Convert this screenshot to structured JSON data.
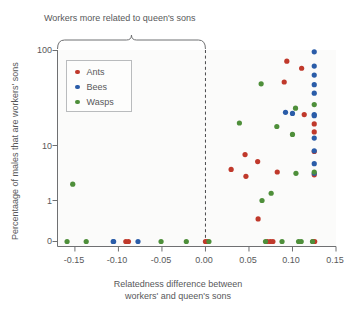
{
  "chart_data": {
    "type": "scatter",
    "title": "",
    "annotation": "Workers more related to queen's sons",
    "xlabel_line1": "Relatedness difference between",
    "xlabel_line2": "workers' and queen's sons",
    "ylabel": "Percentaage of males that are workers' sons",
    "xlim": [
      -0.17,
      0.15
    ],
    "ylim_note": "log-like axis with 0 shown below 1",
    "xticks": [
      -0.15,
      -0.1,
      -0.05,
      0.0,
      0.05,
      0.1,
      0.15
    ],
    "xticklabels": [
      "-0.15",
      "-0.10",
      "-0.05",
      "0.00",
      "0.05",
      "0.10",
      "0.15"
    ],
    "yticks": [
      100,
      10,
      1,
      0
    ],
    "yticklabels": [
      "100",
      "10",
      "1",
      "0"
    ],
    "grid": false,
    "legend_position": "upper-left",
    "reference_line_x": 0.0,
    "colors": {
      "ants": "#c0392b",
      "bees": "#2a5ca8",
      "wasps": "#4e8f3a",
      "axis": "#6f7072",
      "text": "#58585a",
      "plot_bg": "#fbfbfa"
    },
    "series": [
      {
        "name": "Ants",
        "color": "#c0392b",
        "points": [
          [
            -0.0915,
            0
          ],
          [
            -0.0885,
            0
          ],
          [
            0.0295,
            2.6
          ],
          [
            0.0455,
            4.1
          ],
          [
            0.0465,
            2.1
          ],
          [
            0.06,
            3.3
          ],
          [
            0.0605,
            0.55
          ],
          [
            0.071,
            0
          ],
          [
            0.0745,
            0
          ],
          [
            0.0775,
            0
          ],
          [
            0.0825,
            2.4
          ],
          [
            0.0905,
            38
          ],
          [
            0.0935,
            72
          ],
          [
            0.1105,
            58
          ],
          [
            0.1135,
            14
          ],
          [
            0.1235,
            0
          ],
          [
            0.125,
            10.5
          ],
          [
            0.125,
            8.2
          ],
          [
            0.125,
            4.5
          ],
          [
            0.125,
            2.2
          ],
          [
            0.1255,
            0
          ],
          [
            0.0,
            0
          ],
          [
            0.0025,
            0
          ]
        ]
      },
      {
        "name": "Bees",
        "color": "#2a5ca8",
        "points": [
          [
            -0.106,
            0
          ],
          [
            -0.1055,
            0
          ],
          [
            -0.0775,
            0
          ],
          [
            0.092,
            15
          ],
          [
            0.1,
            14.5
          ],
          [
            0.125,
            96
          ],
          [
            0.125,
            62
          ],
          [
            0.125,
            47
          ],
          [
            0.125,
            35
          ],
          [
            0.125,
            27
          ],
          [
            0.125,
            14
          ],
          [
            0.125,
            13.5
          ],
          [
            0.125,
            6.8
          ],
          [
            0.125,
            4.6
          ],
          [
            0.125,
            3.1
          ],
          [
            0.125,
            2.3
          ]
        ]
      },
      {
        "name": "Wasps",
        "color": "#4e8f3a",
        "points": [
          [
            -0.1525,
            1.65
          ],
          [
            -0.159,
            0
          ],
          [
            -0.137,
            0
          ],
          [
            -0.051,
            0
          ],
          [
            -0.022,
            0
          ],
          [
            0.004,
            0
          ],
          [
            0.039,
            10.8
          ],
          [
            0.064,
            36
          ],
          [
            0.065,
            1.0
          ],
          [
            0.069,
            0
          ],
          [
            0.0755,
            1.25
          ],
          [
            0.082,
            9.7
          ],
          [
            0.088,
            0
          ],
          [
            0.1,
            7.6
          ],
          [
            0.1035,
            17
          ],
          [
            0.104,
            2.3
          ],
          [
            0.107,
            0
          ],
          [
            0.11,
            0
          ],
          [
            0.123,
            0
          ],
          [
            0.125,
            19
          ],
          [
            0.125,
            2.4
          ]
        ]
      }
    ]
  },
  "legend": {
    "items": [
      {
        "label": "Ants",
        "color": "#c0392b"
      },
      {
        "label": "Bees",
        "color": "#2a5ca8"
      },
      {
        "label": "Wasps",
        "color": "#4e8f3a"
      }
    ]
  }
}
